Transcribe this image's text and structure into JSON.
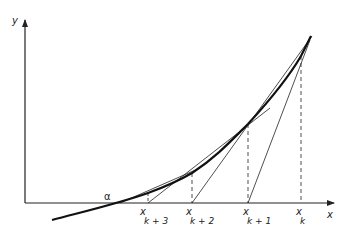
{
  "diagram": {
    "axes": {
      "x_label": "x",
      "y_label": "y"
    },
    "root_label": "α",
    "points": [
      {
        "label": "x",
        "subscript": "k",
        "x": 301
      },
      {
        "label": "x",
        "subscript": "k+1",
        "x": 248
      },
      {
        "label": "x",
        "subscript": "k+2",
        "x": 192
      },
      {
        "label": "x",
        "subscript": "k+3",
        "x": 148
      }
    ],
    "colors": {
      "ink": "#222222",
      "background": "#ffffff"
    }
  }
}
